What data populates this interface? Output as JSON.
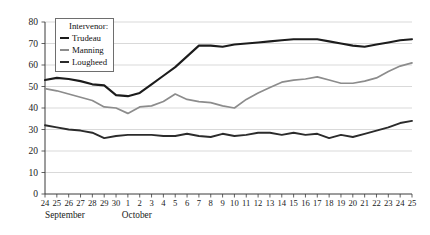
{
  "chart_data": {
    "type": "line",
    "title": "",
    "xlabel": "",
    "ylabel": "",
    "ylim": [
      0,
      80
    ],
    "ytick_step": 10,
    "grid": true,
    "legend_position": "top-left",
    "legend_title": "Intervenor:",
    "categories": [
      "24",
      "25",
      "26",
      "27",
      "28",
      "29",
      "30",
      "1",
      "2",
      "3",
      "4",
      "5",
      "6",
      "7",
      "8",
      "9",
      "10",
      "11",
      "12",
      "13",
      "14",
      "15",
      "16",
      "17",
      "18",
      "19",
      "20",
      "21",
      "22",
      "23",
      "24",
      "25"
    ],
    "month_groups": [
      {
        "label": "September",
        "start_index": 0,
        "end_index": 6
      },
      {
        "label": "October",
        "start_index": 7,
        "end_index": 31
      }
    ],
    "yticks": [
      "0",
      "10",
      "20",
      "30",
      "40",
      "50",
      "60",
      "70",
      "80"
    ],
    "series": [
      {
        "name": "Trudeau",
        "color": "#1c1c1c",
        "width": 2.1,
        "values": [
          53,
          54,
          53.5,
          52.5,
          51,
          50.5,
          46,
          45.5,
          47,
          51,
          55,
          59,
          64,
          69,
          69,
          68.5,
          69.5,
          70,
          70.5,
          71,
          71.5,
          72,
          72,
          72,
          71,
          70,
          69,
          68.5,
          69.5,
          70.5,
          71.5,
          72
        ]
      },
      {
        "name": "Manning",
        "color": "#8c8c8c",
        "width": 1.7,
        "values": [
          49,
          48,
          46.5,
          45,
          43.5,
          40.5,
          40,
          37.5,
          40.5,
          41,
          43,
          46.5,
          44,
          43,
          42.5,
          41,
          40,
          44,
          47,
          49.5,
          52,
          53,
          53.5,
          54.5,
          53,
          51.5,
          51.5,
          52.5,
          54,
          57,
          59.5,
          61
        ]
      },
      {
        "name": "Lougheed",
        "color": "#2b2b2b",
        "width": 1.9,
        "values": [
          32,
          31,
          30,
          29.5,
          28.5,
          26,
          27,
          27.5,
          27.5,
          27.5,
          27,
          27,
          28,
          27,
          26.5,
          28,
          27,
          27.5,
          28.5,
          28.5,
          27.5,
          28.5,
          27.5,
          28,
          26,
          27.5,
          26.5,
          28,
          29.5,
          31,
          33,
          34
        ]
      }
    ]
  }
}
